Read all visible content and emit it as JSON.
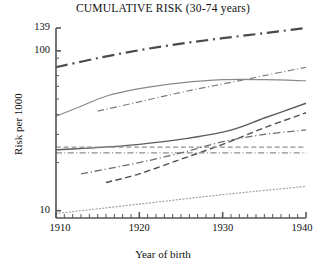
{
  "chart_data": {
    "type": "line",
    "title": "CUMULATIVE RISK (30-74 years)",
    "xlabel": "Year of birth",
    "ylabel": "Risk per 1000",
    "xlim": [
      1910,
      1940
    ],
    "ylim": [
      9,
      139
    ],
    "yscale": "log",
    "grid": false,
    "legend": "none",
    "x_ticks_major": [
      1910,
      1920,
      1930,
      1940
    ],
    "x_tick_labels": [
      "1910",
      "1920",
      "1930",
      "1940"
    ],
    "x_minor_tick_step": 1,
    "y_ticks_labeled": [
      139,
      100,
      10
    ],
    "y_tick_labels": [
      "139",
      "100",
      "10"
    ],
    "x": [
      1910,
      1915,
      1920,
      1925,
      1930,
      1935,
      1940
    ],
    "series": [
      {
        "name": "series-1",
        "style": "dash-dot",
        "width": 2.2,
        "color": "#4a4a4a",
        "x": [
          1910,
          1915,
          1920,
          1925,
          1930,
          1935,
          1940
        ],
        "values": [
          79,
          90,
          101,
          111,
          120,
          129,
          139
        ]
      },
      {
        "name": "series-2",
        "style": "dash-dot",
        "width": 1.2,
        "color": "#7d7d7d",
        "x": [
          1915,
          1920,
          1925,
          1930,
          1935,
          1940
        ],
        "values": [
          42,
          48,
          55,
          62,
          70,
          79
        ]
      },
      {
        "name": "series-3",
        "style": "solid",
        "width": 1.2,
        "color": "#8a8a8a",
        "x": [
          1910,
          1913,
          1916,
          1920,
          1925,
          1930,
          1935,
          1940
        ],
        "values": [
          39,
          45,
          52,
          58,
          63,
          66,
          66,
          65
        ]
      },
      {
        "name": "series-4",
        "style": "solid",
        "width": 1.4,
        "color": "#5c5c5c",
        "x": [
          1910,
          1920,
          1930,
          1935,
          1940
        ],
        "values": [
          24,
          26,
          31,
          38,
          47
        ]
      },
      {
        "name": "series-5",
        "style": "dashed",
        "width": 1.4,
        "color": "#4f4f4f",
        "x": [
          1916,
          1920,
          1925,
          1930,
          1935,
          1940
        ],
        "values": [
          15,
          17,
          21,
          26,
          33,
          41
        ]
      },
      {
        "name": "series-6",
        "style": "dashed",
        "width": 1.1,
        "color": "#909090",
        "x": [
          1910,
          1920,
          1930,
          1940
        ],
        "values": [
          25,
          25,
          25,
          25
        ]
      },
      {
        "name": "series-7",
        "style": "dash-dot",
        "width": 1.1,
        "color": "#8d8d8d",
        "x": [
          1910,
          1920,
          1930,
          1940
        ],
        "values": [
          23,
          23,
          23,
          23
        ]
      },
      {
        "name": "series-8",
        "style": "dash-dot",
        "width": 1.3,
        "color": "#6e6e6e",
        "x": [
          1913,
          1920,
          1925,
          1930,
          1935,
          1940
        ],
        "values": [
          17,
          20,
          23,
          27,
          30,
          32
        ]
      },
      {
        "name": "series-9",
        "style": "dotted",
        "width": 1.2,
        "color": "#a2a2a2",
        "x": [
          1910,
          1920,
          1930,
          1940
        ],
        "values": [
          9.6,
          11.0,
          12.6,
          14.2
        ]
      }
    ]
  },
  "axes": {
    "spine_color": "#555555"
  }
}
